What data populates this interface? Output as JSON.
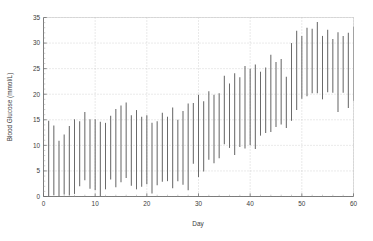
{
  "chart_data": {
    "type": "bar",
    "subtype": "vertical-range-bars",
    "title": "",
    "xlabel": "Day",
    "ylabel": "Blood Glucose (mmol/L)",
    "xlim": [
      0,
      60
    ],
    "ylim": [
      0,
      35
    ],
    "xticks": [
      0,
      10,
      20,
      30,
      40,
      50,
      60
    ],
    "yticks": [
      0,
      5,
      10,
      15,
      20,
      25,
      30,
      35
    ],
    "grid": true,
    "legend": null,
    "series_color": "#6a6a6a",
    "x": [
      1,
      2,
      3,
      4,
      5,
      6,
      7,
      8,
      9,
      10,
      11,
      12,
      13,
      14,
      15,
      16,
      17,
      18,
      19,
      20,
      21,
      22,
      23,
      24,
      25,
      26,
      27,
      28,
      29,
      30,
      31,
      32,
      33,
      34,
      35,
      36,
      37,
      38,
      39,
      40,
      41,
      42,
      43,
      44,
      45,
      46,
      47,
      48,
      49,
      50,
      51,
      52,
      53,
      54,
      55,
      56,
      57,
      58,
      59,
      60
    ],
    "series": [
      {
        "name": "Daily minimum",
        "values": [
          0.0,
          0.3,
          0.1,
          0.4,
          0.2,
          0.5,
          2.0,
          3.2,
          1.5,
          1.2,
          0.1,
          1.4,
          3.3,
          1.8,
          2.8,
          3.6,
          2.1,
          1.4,
          1.9,
          2.4,
          0.6,
          2.2,
          2.9,
          3.0,
          1.6,
          3.0,
          2.3,
          1.2,
          6.4,
          3.8,
          4.9,
          7.2,
          6.5,
          7.5,
          10.2,
          9.5,
          8.1,
          9.7,
          9.4,
          10.0,
          9.3,
          11.9,
          12.4,
          12.6,
          13.6,
          14.1,
          13.4,
          14.8,
          16.9,
          19.1,
          19.6,
          20.2,
          20.2,
          19.0,
          20.4,
          20.3,
          16.5,
          20.3,
          17.3,
          18.7
        ]
      },
      {
        "name": "Daily maximum",
        "values": [
          14.8,
          13.9,
          10.9,
          12.1,
          13.8,
          15.1,
          14.7,
          16.5,
          15.1,
          15.1,
          14.6,
          14.4,
          15.8,
          17.1,
          17.8,
          18.4,
          15.9,
          16.9,
          15.6,
          15.9,
          14.4,
          14.7,
          16.4,
          15.6,
          17.4,
          15.0,
          16.7,
          18.2,
          18.3,
          19.9,
          18.6,
          20.6,
          19.9,
          20.2,
          23.6,
          22.1,
          24.1,
          23.3,
          25.5,
          25.0,
          25.8,
          24.4,
          25.2,
          27.7,
          26.3,
          26.9,
          23.4,
          30.0,
          32.4,
          31.4,
          33.0,
          32.8,
          34.1,
          31.4,
          32.6,
          30.8,
          32.1,
          31.4,
          32.0,
          33.2
        ]
      }
    ]
  },
  "axes": {
    "y_axis_label": "Blood Glucose (mmol/L)",
    "x_axis_label": "Day",
    "y_tick_labels": [
      "0",
      "5",
      "10",
      "15",
      "20",
      "25",
      "30",
      "35"
    ],
    "x_tick_labels": [
      "0",
      "10",
      "20",
      "30",
      "40",
      "50",
      "60"
    ]
  }
}
